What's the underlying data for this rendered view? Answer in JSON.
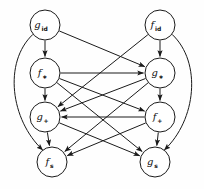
{
  "figure": {
    "kind": "directed-acyclic-graph",
    "background_color": "#fefefe",
    "line_color": "#1a1a1a",
    "node_fill_color": "#ffffff"
  },
  "nodes": [
    {
      "id": "g_id",
      "base": "g",
      "sub": "id",
      "x": 45,
      "y": 25,
      "r": 15
    },
    {
      "id": "f_id",
      "base": "f",
      "sub": "id",
      "x": 160,
      "y": 25,
      "r": 15
    },
    {
      "id": "f_mul",
      "base": "f",
      "sub": "∗",
      "x": 45,
      "y": 73,
      "r": 15
    },
    {
      "id": "g_mul",
      "base": "g",
      "sub": "∗",
      "x": 160,
      "y": 73,
      "r": 15
    },
    {
      "id": "g_plus",
      "base": "g",
      "sub": "+",
      "x": 45,
      "y": 117,
      "r": 15
    },
    {
      "id": "f_plus",
      "base": "f",
      "sub": "+",
      "x": 160,
      "y": 117,
      "r": 15
    },
    {
      "id": "f_s",
      "base": "f",
      "sub": "s",
      "x": 52,
      "y": 162,
      "r": 15
    },
    {
      "id": "g_s",
      "base": "g",
      "sub": "s",
      "x": 155,
      "y": 162,
      "r": 15
    }
  ],
  "edges": [
    {
      "from": "g_id",
      "to": "f_mul",
      "style": "straight"
    },
    {
      "from": "g_id",
      "to": "g_mul",
      "style": "straight"
    },
    {
      "from": "g_id",
      "to": "f_s",
      "style": "curve-left"
    },
    {
      "from": "f_id",
      "to": "g_mul",
      "style": "straight"
    },
    {
      "from": "f_id",
      "to": "g_plus",
      "style": "straight"
    },
    {
      "from": "f_id",
      "to": "g_s",
      "style": "curve-right"
    },
    {
      "from": "f_mul",
      "to": "g_mul",
      "style": "straight"
    },
    {
      "from": "f_mul",
      "to": "g_plus",
      "style": "straight"
    },
    {
      "from": "f_mul",
      "to": "f_plus",
      "style": "straight"
    },
    {
      "from": "f_mul",
      "to": "g_s",
      "style": "straight"
    },
    {
      "from": "g_mul",
      "to": "g_plus",
      "style": "straight"
    },
    {
      "from": "g_mul",
      "to": "f_plus",
      "style": "straight"
    },
    {
      "from": "g_mul",
      "to": "f_s",
      "style": "straight"
    },
    {
      "from": "f_plus",
      "to": "g_plus",
      "style": "straight"
    },
    {
      "from": "f_plus",
      "to": "f_s",
      "style": "straight"
    },
    {
      "from": "f_plus",
      "to": "g_s",
      "style": "straight"
    },
    {
      "from": "g_plus",
      "to": "f_s",
      "style": "straight"
    },
    {
      "from": "g_plus",
      "to": "g_s",
      "style": "straight"
    }
  ]
}
